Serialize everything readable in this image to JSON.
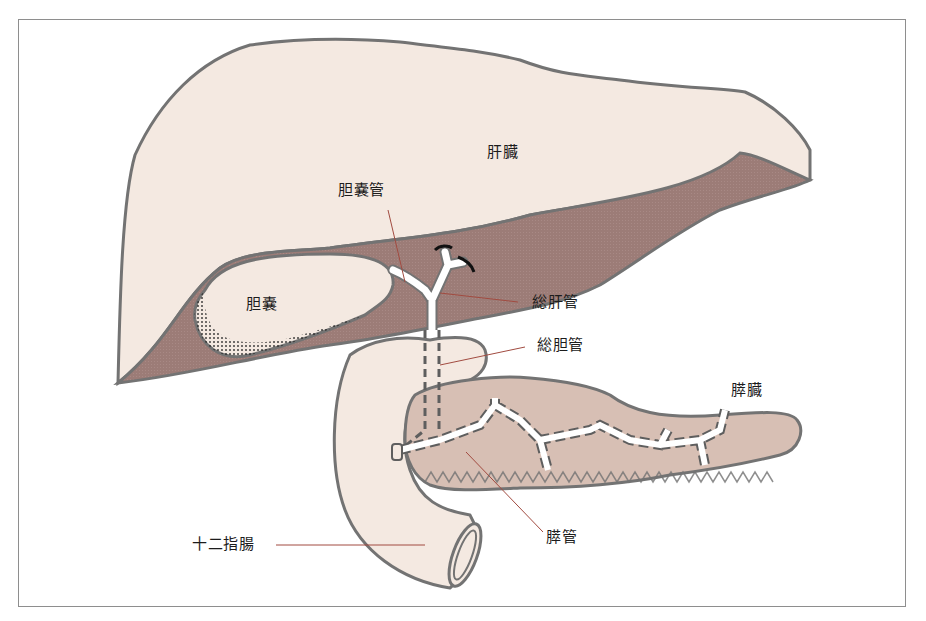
{
  "diagram": {
    "type": "anatomical illustration",
    "colors": {
      "liver_fill": "#f4e9e1",
      "liver_shadow_fill": "#9c7c77",
      "pancreas_fill": "#d7bfb4",
      "duodenum_fill": "#f4e9e1",
      "outline": "#737373",
      "duct_fill": "#ffffff",
      "leader_line": "#a14b40",
      "frame": "#8e8e8e"
    },
    "labels": {
      "liver": "肝臓",
      "cystic_duct": "胆嚢管",
      "gallbladder": "胆嚢",
      "common_hepatic_duct": "総肝管",
      "common_bile_duct": "総胆管",
      "pancreas": "膵臓",
      "duodenum": "十二指腸",
      "pancreatic_duct": "膵管"
    }
  }
}
